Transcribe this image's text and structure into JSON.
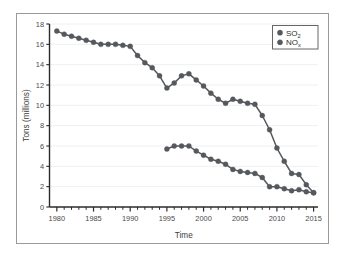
{
  "chart_data": {
    "type": "line",
    "title": "",
    "xlabel": "Time",
    "ylabel": "Tons (millions)",
    "xlim": [
      1979,
      2015.6
    ],
    "ylim": [
      0,
      18
    ],
    "xticks": [
      1980,
      1985,
      1990,
      1995,
      2000,
      2005,
      2010,
      2015
    ],
    "xtick_labels": [
      "1980",
      "1985",
      "1990",
      "1995",
      "2000",
      "2005",
      "2010",
      "2015"
    ],
    "minor_xtick_interval": 1,
    "yticks": [
      0,
      2,
      4,
      6,
      8,
      10,
      12,
      14,
      16,
      18
    ],
    "ytick_labels": [
      "0",
      "2",
      "4",
      "6",
      "8",
      "10",
      "12",
      "14",
      "16",
      "18"
    ],
    "grid": "horizontal-faint",
    "legend_position": "upper-right",
    "marker": "circle",
    "marker_color": "#55585c",
    "line_color": "#55585c",
    "series": [
      {
        "name": "SO2",
        "label": "SO",
        "subscript": "2",
        "color": "#55585c",
        "x": [
          1980,
          1981,
          1982,
          1983,
          1984,
          1985,
          1986,
          1987,
          1988,
          1989,
          1990,
          1991,
          1992,
          1993,
          1994,
          1995,
          1996,
          1997,
          1998,
          1999,
          2000,
          2001,
          2002,
          2003,
          2004,
          2005,
          2006,
          2007,
          2008,
          2009,
          2010,
          2011,
          2012,
          2013,
          2014,
          2015
        ],
        "values": [
          17.3,
          17.0,
          16.8,
          16.6,
          16.4,
          16.2,
          16.0,
          16.0,
          16.0,
          15.9,
          15.8,
          14.9,
          14.2,
          13.7,
          12.9,
          11.7,
          12.2,
          12.9,
          13.1,
          12.5,
          11.9,
          11.2,
          10.6,
          10.2,
          10.6,
          10.4,
          10.2,
          10.1,
          9.0,
          7.6,
          5.8,
          4.5,
          3.3,
          3.2,
          2.2,
          1.4
        ]
      },
      {
        "name": "NOx",
        "label": "NO",
        "subscript": "x",
        "color": "#55585c",
        "x": [
          1995,
          1996,
          1997,
          1998,
          1999,
          2000,
          2001,
          2002,
          2003,
          2004,
          2005,
          2006,
          2007,
          2008,
          2009,
          2010,
          2011,
          2012,
          2013,
          2014,
          2015
        ],
        "values": [
          5.7,
          6.0,
          6.0,
          6.0,
          5.5,
          5.1,
          4.7,
          4.5,
          4.2,
          3.7,
          3.5,
          3.4,
          3.3,
          2.9,
          2.0,
          2.0,
          1.8,
          1.6,
          1.7,
          1.5,
          1.4
        ]
      }
    ]
  },
  "legend": {
    "items": [
      {
        "marker_name": "legend-marker-so2",
        "label": "SO",
        "sub": "2"
      },
      {
        "marker_name": "legend-marker-nox",
        "label": "NO",
        "sub": "x"
      }
    ]
  },
  "axes": {
    "y_title": "Tons (millions)",
    "x_title": "Time"
  },
  "colors": {
    "series": "#55585c",
    "axis": "#2b2b2b",
    "grid": "#f0f0f0",
    "frame": "#9a9a9a",
    "background": "#ffffff"
  }
}
